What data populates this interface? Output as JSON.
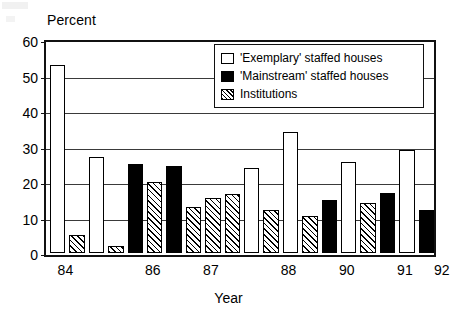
{
  "chart_data": {
    "type": "bar",
    "title": "",
    "xlabel": "Year",
    "ylabel": "Percent",
    "ylim": [
      0,
      60
    ],
    "yticks": [
      0,
      10,
      20,
      30,
      40,
      50,
      60
    ],
    "xtick_labels": [
      "84",
      "86",
      "87",
      "88",
      "90",
      "91",
      "92"
    ],
    "grid": "horizontal",
    "legend_position": "upper-right-inside",
    "series": [
      {
        "name": "'Exemplary' staffed houses",
        "fill": "white",
        "values": [
          53,
          27,
          null,
          null,
          null,
          24,
          34,
          25.5,
          29,
          null
        ]
      },
      {
        "name": "'Mainstream' staffed houses",
        "fill": "black",
        "values": [
          25,
          24.5,
          15,
          17,
          12
        ]
      },
      {
        "name": "Institutions",
        "fill": "hatched",
        "values": [
          5,
          2,
          20,
          13,
          15.5,
          16.5,
          12,
          10.5,
          14
        ]
      }
    ],
    "bars": [
      {
        "series": "exemplary",
        "value": 53
      },
      {
        "series": "institutions",
        "value": 5
      },
      {
        "series": "exemplary",
        "value": 27
      },
      {
        "series": "institutions",
        "value": 2
      },
      {
        "series": "mainstream",
        "value": 25
      },
      {
        "series": "institutions",
        "value": 20
      },
      {
        "series": "mainstream",
        "value": 24.5
      },
      {
        "series": "institutions",
        "value": 13
      },
      {
        "series": "institutions",
        "value": 15.5
      },
      {
        "series": "institutions",
        "value": 16.5
      },
      {
        "series": "exemplary",
        "value": 24
      },
      {
        "series": "institutions",
        "value": 12
      },
      {
        "series": "exemplary",
        "value": 34
      },
      {
        "series": "institutions",
        "value": 10.5
      },
      {
        "series": "mainstream",
        "value": 15
      },
      {
        "series": "exemplary",
        "value": 25.5
      },
      {
        "series": "institutions",
        "value": 14
      },
      {
        "series": "mainstream",
        "value": 17
      },
      {
        "series": "exemplary",
        "value": 29
      },
      {
        "series": "mainstream",
        "value": 12
      }
    ]
  },
  "axes": {
    "ylabel": "Percent",
    "xlabel": "Year",
    "yticks": [
      "60",
      "50",
      "40",
      "30",
      "20",
      "10",
      "0"
    ],
    "xticks": [
      "84",
      "86",
      "87",
      "88",
      "90",
      "91",
      "92"
    ]
  },
  "legend": {
    "items": [
      {
        "label": "'Exemplary' staffed houses",
        "swatch": "white-square-icon"
      },
      {
        "label": "'Mainstream' staffed houses",
        "swatch": "black-square-icon"
      },
      {
        "label": "Institutions",
        "swatch": "hatched-square-icon"
      }
    ]
  },
  "colors": {
    "ink": "#000000",
    "background": "#ffffff",
    "grid": "#3a3a3a"
  }
}
